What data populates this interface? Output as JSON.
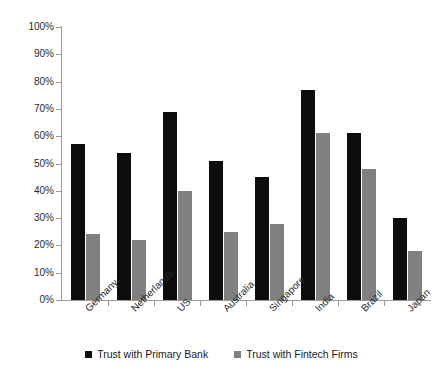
{
  "chart_data": {
    "type": "bar",
    "title": "",
    "subtitle": "",
    "xlabel": "",
    "ylabel": "",
    "ylim": [
      0,
      100
    ],
    "ytick_labels": [
      "100%",
      "90%",
      "80%",
      "70%",
      "60%",
      "50%",
      "40%",
      "30%",
      "20%",
      "10%",
      "0%"
    ],
    "ytick_values": [
      100,
      90,
      80,
      70,
      60,
      50,
      40,
      30,
      20,
      10,
      0
    ],
    "grid": false,
    "legend_position": "bottom",
    "categories": [
      "Germany",
      "Netherlands",
      "US",
      "Australia",
      "Singapore",
      "India",
      "Brazil",
      "Japan"
    ],
    "series": [
      {
        "name": "Trust with Primary Bank",
        "color": "#0d0d0d",
        "values": [
          57,
          54,
          69,
          51,
          45,
          77,
          61,
          30
        ]
      },
      {
        "name": "Trust with Fintech Firms",
        "color": "#808080",
        "values": [
          24,
          22,
          40,
          25,
          28,
          61,
          48,
          18
        ]
      }
    ]
  },
  "legend": {
    "items": [
      {
        "label": "Trust with Primary Bank",
        "swatch": "primary"
      },
      {
        "label": "Trust with Fintech Firms",
        "swatch": "fintech"
      }
    ]
  },
  "colors": {
    "primary_bank": "#0d0d0d",
    "fintech_firms": "#808080",
    "axis": "#9a9a9a",
    "text": "#2b2b2b",
    "background": "#ffffff"
  }
}
